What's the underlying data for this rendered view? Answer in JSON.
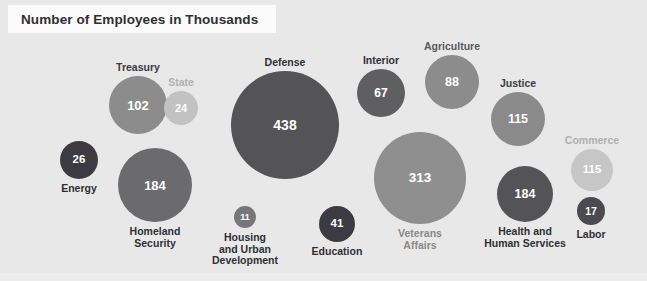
{
  "title": "Number of Employees in Thousands",
  "background_color": "#e8e8e8",
  "title_box_color": "#fbfbfb",
  "title_text_color": "#2f2f33",
  "chart_data": {
    "type": "bubble",
    "title": "Number of Employees in Thousands",
    "unit": "thousands",
    "xlabel": "",
    "ylabel": "",
    "legend": "none",
    "grid": false,
    "categories": [
      "Treasury",
      "State",
      "Defense",
      "Interior",
      "Agriculture",
      "Justice",
      "Commerce",
      "Energy",
      "Homeland Security",
      "Housing and Urban Development",
      "Education",
      "Veterans Affairs",
      "Health and Human Services",
      "Labor"
    ],
    "values": [
      102,
      24,
      438,
      67,
      88,
      115,
      115,
      26,
      184,
      11,
      41,
      313,
      184,
      17
    ],
    "bubbles": [
      {
        "name": "treasury",
        "label": "Treasury",
        "value": "102",
        "cx": 138,
        "cy": 105,
        "r": 29,
        "color": "#8c8c8c",
        "label_color": "#3b3b3f",
        "label_position": "above",
        "value_font_size": 13
      },
      {
        "name": "state",
        "label": "State",
        "value": "24",
        "cx": 181,
        "cy": 108,
        "r": 17,
        "color": "#c2c2c2",
        "label_color": "#b0b0b0",
        "label_position": "above",
        "value_font_size": 11
      },
      {
        "name": "defense",
        "label": "Defense",
        "value": "438",
        "cx": 285,
        "cy": 125,
        "r": 54,
        "color": "#545456",
        "label_color": "#2f2f33",
        "label_position": "above",
        "value_font_size": 14
      },
      {
        "name": "interior",
        "label": "Interior",
        "value": "67",
        "cx": 381,
        "cy": 93,
        "r": 24,
        "color": "#5f5f61",
        "label_color": "#2f2f33",
        "label_position": "above",
        "value_font_size": 12
      },
      {
        "name": "agriculture",
        "label": "Agriculture",
        "value": "88",
        "cx": 452,
        "cy": 82,
        "r": 27,
        "color": "#8c8c8c",
        "label_color": "#5a5a5e",
        "label_position": "above",
        "value_font_size": 12.5
      },
      {
        "name": "justice",
        "label": "Justice",
        "value": "115",
        "cx": 518,
        "cy": 119,
        "r": 27,
        "color": "#8a8a8a",
        "label_color": "#3b3b3f",
        "label_position": "above",
        "value_font_size": 12.5
      },
      {
        "name": "commerce",
        "label": "Commerce",
        "value": "115",
        "cx": 592,
        "cy": 170,
        "r": 21,
        "color": "#c6c6c6",
        "label_color": "#b0b0b0",
        "label_position": "above",
        "value_font_size": 11.5
      },
      {
        "name": "energy",
        "label": "Energy",
        "value": "26",
        "cx": 79,
        "cy": 160,
        "r": 19,
        "color": "#3b3b41",
        "label_color": "#2f2f33",
        "label_position": "below",
        "value_font_size": 11.5
      },
      {
        "name": "homeland-security",
        "label": "Homeland\nSecurity",
        "value": "184",
        "cx": 155,
        "cy": 185,
        "r": 37,
        "color": "#6b6b6d",
        "label_color": "#2f2f33",
        "label_position": "below",
        "value_font_size": 13
      },
      {
        "name": "housing-and-urban-development",
        "label": "Housing\nand Urban\nDevelopment",
        "value": "11",
        "cx": 245,
        "cy": 217,
        "r": 11,
        "color": "#77777a",
        "label_color": "#2f2f33",
        "label_position": "below",
        "value_font_size": 9
      },
      {
        "name": "education",
        "label": "Education",
        "value": "41",
        "cx": 337,
        "cy": 224,
        "r": 18,
        "color": "#3b3b41",
        "label_color": "#2f2f33",
        "label_position": "below",
        "value_font_size": 11.5
      },
      {
        "name": "veterans-affairs",
        "label": "Veterans\nAffairs",
        "value": "313",
        "cx": 420,
        "cy": 178,
        "r": 46,
        "color": "#8f8f8f",
        "label_color": "#8a8a8a",
        "label_position": "below",
        "value_font_size": 13.5
      },
      {
        "name": "health-and-human-services",
        "label": "Health and\nHuman Services",
        "value": "184",
        "cx": 525,
        "cy": 194,
        "r": 28,
        "color": "#545456",
        "label_color": "#2f2f33",
        "label_position": "below",
        "value_font_size": 12.5
      },
      {
        "name": "labor",
        "label": "Labor",
        "value": "17",
        "cx": 591,
        "cy": 211,
        "r": 14,
        "color": "#4a4a4f",
        "label_color": "#2f2f33",
        "label_position": "below",
        "value_font_size": 10.5
      }
    ]
  }
}
